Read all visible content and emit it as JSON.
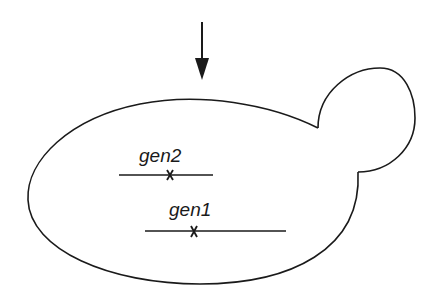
{
  "diagram": {
    "type": "yeast-cell-budding",
    "colors": {
      "stroke": "#1a1a1a",
      "background": "#ffffff"
    },
    "arrow": {
      "direction": "down"
    },
    "genes": [
      {
        "label": "gen2",
        "mark": "x"
      },
      {
        "label": "gen1",
        "mark": "x"
      }
    ]
  }
}
